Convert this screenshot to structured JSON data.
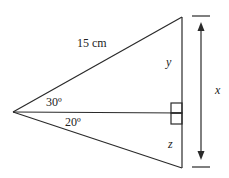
{
  "diagram": {
    "type": "triangle-trigonometry",
    "labels": {
      "hypotenuse": "15 cm",
      "y": "y",
      "x": "x",
      "z": "z",
      "angle_top": "30º",
      "angle_bottom": "20º"
    },
    "colors": {
      "stroke": "#2a2a2a",
      "text": "#222222",
      "background": "#ffffff"
    }
  }
}
